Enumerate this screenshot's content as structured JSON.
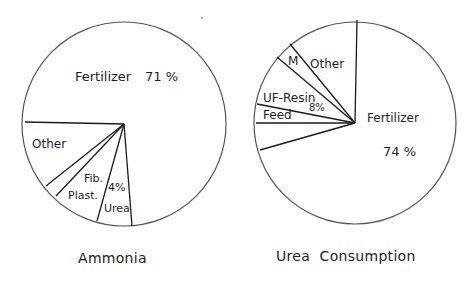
{
  "chart_data": [
    {
      "type": "pie",
      "title": "Ammonia",
      "center": [
        124,
        124
      ],
      "radius": 102,
      "spoke_endpoints": [
        [
          25,
          122
        ],
        [
          46,
          186
        ],
        [
          56,
          196
        ],
        [
          97,
          221
        ],
        [
          132,
          226
        ]
      ],
      "slices": [
        {
          "label": "Fertilizer",
          "value": 71,
          "value_label": "71 %"
        },
        {
          "label": "Other",
          "value": null
        },
        {
          "label": "Fib.",
          "value": null
        },
        {
          "label": "Plast.",
          "value": null
        },
        {
          "label": "Urea",
          "value": 4,
          "value_label": "4%"
        }
      ],
      "labels": [
        {
          "text": "Fertilizer",
          "x": 75,
          "y": 70,
          "size": 13
        },
        {
          "text": "71 %",
          "x": 145,
          "y": 70,
          "size": 13
        },
        {
          "text": "Other",
          "x": 32,
          "y": 138,
          "size": 12
        },
        {
          "text": "Fib.",
          "x": 84,
          "y": 173,
          "size": 11
        },
        {
          "text": "4%",
          "x": 108,
          "y": 182,
          "size": 11
        },
        {
          "text": "Plast.",
          "x": 68,
          "y": 190,
          "size": 11
        },
        {
          "text": "Urea",
          "x": 104,
          "y": 203,
          "size": 11
        }
      ]
    },
    {
      "type": "pie",
      "title": "Urea Consumption",
      "center": [
        355,
        123
      ],
      "radius": 101,
      "spoke_endpoints": [
        [
          357,
          20
        ],
        [
          290,
          44
        ],
        [
          277,
          57
        ],
        [
          257,
          104
        ],
        [
          256,
          123
        ],
        [
          260,
          150
        ]
      ],
      "slices": [
        {
          "label": "Fertilizer",
          "value": 74,
          "value_label": "74 %"
        },
        {
          "label": "Other",
          "value": null
        },
        {
          "label": "M",
          "value": null
        },
        {
          "label": "UF-Resin",
          "value": 8,
          "value_label": "8%"
        },
        {
          "label": "Feed",
          "value": null
        },
        {
          "label": "(unlabeled)",
          "value": null
        }
      ],
      "labels": [
        {
          "text": "M",
          "x": 288,
          "y": 55,
          "size": 12
        },
        {
          "text": "Other",
          "x": 310,
          "y": 58,
          "size": 12
        },
        {
          "text": "UF-Resin",
          "x": 263,
          "y": 92,
          "size": 12
        },
        {
          "text": "8%",
          "x": 309,
          "y": 103,
          "size": 10
        },
        {
          "text": "Feed",
          "x": 263,
          "y": 109,
          "size": 12
        },
        {
          "text": "Fertilizer",
          "x": 367,
          "y": 112,
          "size": 12
        },
        {
          "text": "74 %",
          "x": 383,
          "y": 145,
          "size": 13
        }
      ]
    }
  ],
  "captions": {
    "left": "Ammonia",
    "right": "Urea  Consumption"
  },
  "style": {
    "outline_color": "#555555",
    "spoke_color": "#1a1a1a",
    "text_color": "#1e1e1e"
  }
}
